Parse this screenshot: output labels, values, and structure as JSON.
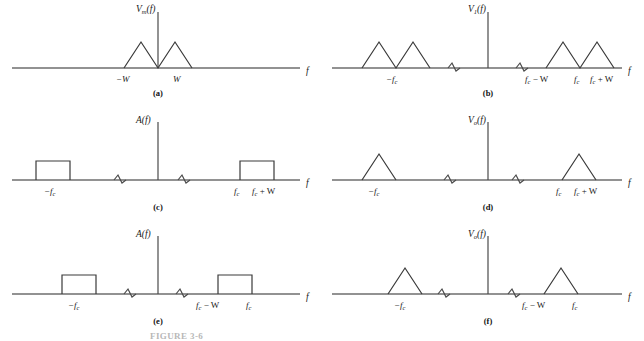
{
  "figure": {
    "caption": "FIGURE 3-6",
    "background_color": "#ffffff",
    "line_color": "#3a3a3a",
    "axis_color": "#6e6e6e"
  },
  "panels": [
    {
      "id": "a",
      "caption": "(a)",
      "y_axis_label": "V",
      "y_axis_sub": "m",
      "y_axis_tail": "(f)",
      "x_axis_label": "f",
      "shape": "double-triangle",
      "ticks": [
        {
          "label_main": "−W",
          "label_sub": "",
          "label_tail": ""
        },
        {
          "label_main": "W",
          "label_sub": "",
          "label_tail": ""
        }
      ],
      "breaks": 0
    },
    {
      "id": "b",
      "caption": "(b)",
      "y_axis_label": "V",
      "y_axis_sub": "1",
      "y_axis_tail": "(f)",
      "x_axis_label": "f",
      "shape": "double-triangle-pair",
      "ticks": [
        {
          "label_main": "−f",
          "label_sub": "c",
          "label_tail": ""
        },
        {
          "label_main": "f",
          "label_sub": "c",
          "label_tail": " − W"
        },
        {
          "label_main": "f",
          "label_sub": "c",
          "label_tail": ""
        },
        {
          "label_main": "f",
          "label_sub": "c",
          "label_tail": " + W"
        }
      ],
      "breaks": 2
    },
    {
      "id": "c",
      "caption": "(c)",
      "y_axis_label": "A",
      "y_axis_sub": "",
      "y_axis_tail": "(f)",
      "x_axis_label": "f",
      "shape": "rectangle-upper",
      "ticks": [
        {
          "label_main": "−f",
          "label_sub": "c",
          "label_tail": ""
        },
        {
          "label_main": "f",
          "label_sub": "c",
          "label_tail": ""
        },
        {
          "label_main": "f",
          "label_sub": "c",
          "label_tail": " + W"
        }
      ],
      "breaks": 2
    },
    {
      "id": "d",
      "caption": "(d)",
      "y_axis_label": "V",
      "y_axis_sub": "o",
      "y_axis_tail": "(f)",
      "x_axis_label": "f",
      "shape": "triangle-upper",
      "ticks": [
        {
          "label_main": "−f",
          "label_sub": "c",
          "label_tail": ""
        },
        {
          "label_main": "f",
          "label_sub": "c",
          "label_tail": ""
        },
        {
          "label_main": "f",
          "label_sub": "c",
          "label_tail": " + W"
        }
      ],
      "breaks": 2
    },
    {
      "id": "e",
      "caption": "(e)",
      "y_axis_label": "A",
      "y_axis_sub": "",
      "y_axis_tail": "(f)",
      "x_axis_label": "f",
      "shape": "rectangle-lower",
      "ticks": [
        {
          "label_main": "−f",
          "label_sub": "c",
          "label_tail": ""
        },
        {
          "label_main": "f",
          "label_sub": "c",
          "label_tail": " − W"
        },
        {
          "label_main": "f",
          "label_sub": "c",
          "label_tail": ""
        }
      ],
      "breaks": 2
    },
    {
      "id": "f",
      "caption": "(f)",
      "y_axis_label": "V",
      "y_axis_sub": "o",
      "y_axis_tail": "(f)",
      "x_axis_label": "f",
      "shape": "triangle-lower",
      "ticks": [
        {
          "label_main": "−f",
          "label_sub": "c",
          "label_tail": ""
        },
        {
          "label_main": "f",
          "label_sub": "c",
          "label_tail": " − W"
        },
        {
          "label_main": "f",
          "label_sub": "c",
          "label_tail": ""
        }
      ],
      "breaks": 2
    }
  ]
}
